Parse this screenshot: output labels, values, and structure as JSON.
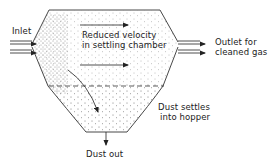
{
  "diagram": {
    "type": "settling-chamber-schematic",
    "labels": {
      "inlet": "Inlet",
      "velocity_line1": "Reduced velocity",
      "velocity_line2": "in settling chamber",
      "outlet_line1": "Outlet for",
      "outlet_line2": "cleaned gas",
      "settle_line1": "Dust settles",
      "settle_line2": "into hopper",
      "dust_out": "Dust out"
    },
    "colors": {
      "line": "#333333",
      "dots": "#555555",
      "background": "#ffffff"
    }
  }
}
